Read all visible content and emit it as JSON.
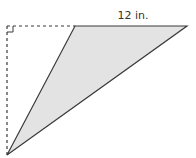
{
  "diagram": {
    "type": "obtuse-triangle-with-height",
    "labels": {
      "base": "12 in."
    },
    "colors": {
      "fill": "#e3e3e3",
      "stroke": "#3a3a3a",
      "dashed": "#3a3a3a",
      "text": "#333333"
    },
    "points": {
      "base_left": [
        75,
        26
      ],
      "base_right": [
        187,
        26
      ],
      "apex": [
        7,
        155
      ],
      "height_foot": [
        7,
        26
      ]
    },
    "right_angle_marker": {
      "at": [
        7,
        26
      ],
      "size": 6
    }
  }
}
